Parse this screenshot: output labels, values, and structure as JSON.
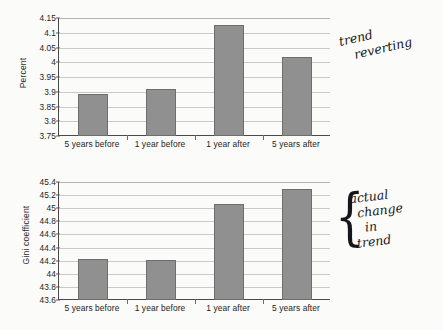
{
  "chart_data": [
    {
      "type": "bar",
      "title": "",
      "xlabel": "",
      "ylabel": "Percent",
      "categories": [
        "5 years before",
        "1 year before",
        "1 year after",
        "5 years after"
      ],
      "values": [
        3.893,
        3.911,
        4.125,
        4.018
      ],
      "ylim": [
        3.75,
        4.15
      ],
      "yticks": [
        "3.75",
        "3.8",
        "3.85",
        "3.9",
        "3.95",
        "4",
        "4.05",
        "4.1",
        "4.15"
      ],
      "ytick_values": [
        3.75,
        3.8,
        3.85,
        3.9,
        3.95,
        4.0,
        4.05,
        4.1,
        4.15
      ],
      "grid": true,
      "legend": "none",
      "bar_color": "#909090",
      "bar_border_color": "#6e6e6e"
    },
    {
      "type": "bar",
      "title": "",
      "xlabel": "",
      "ylabel": "Gini coefficient",
      "categories": [
        "5 years before",
        "1 year before",
        "1 year after",
        "5 years after"
      ],
      "values": [
        44.22,
        44.21,
        45.07,
        45.29
      ],
      "ylim": [
        43.6,
        45.4
      ],
      "yticks": [
        "43.6",
        "43.8",
        "44",
        "44.2",
        "44.4",
        "44.6",
        "44.8",
        "45",
        "45.2",
        "45.4"
      ],
      "ytick_values": [
        43.6,
        43.8,
        44.0,
        44.2,
        44.4,
        44.6,
        44.8,
        45.0,
        45.2,
        45.4
      ],
      "grid": true,
      "legend": "none",
      "bar_color": "#909090",
      "bar_border_color": "#6e6e6e"
    }
  ],
  "annotations": {
    "top": {
      "line1": "trend",
      "line2": "reverting"
    },
    "bottom": {
      "brace": "{",
      "line1": "actual",
      "line2": "change",
      "line3": "in",
      "line4": "trend"
    }
  }
}
